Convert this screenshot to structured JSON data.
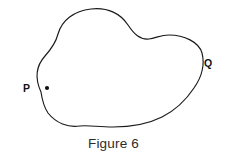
{
  "figure": {
    "caption": "Figure 6",
    "background_color": "#ffffff",
    "stroke_color": "#1a1a1a",
    "label_color": "#111111",
    "shape": {
      "name": "closed-freeform-blob",
      "description": "Irregular closed freeform curve (blob) drawn by hand, wider than tall, with a rounded peak at upper left, a wavy indentation along the upper right, a rounded right lobe, and a gentle bump along the bottom edge.",
      "outline_path": "M 41,92 C 35,79 36,66 45,56 C 53,47 56,42 58,34 C 62,20 74,11 91,9 C 108,7 121,14 128,25 C 134,34 140,40 149,39 C 156,38 161,35 169,35 C 184,35 199,42 202,53 C 205,65 201,78 194,88 C 186,100 176,110 162,117 C 148,124 131,127 113,127 C 98,127 88,125 80,126 C 68,128 56,123 48,113 C 44,107 42,99 41,92 Z"
    },
    "points": [
      {
        "id": "P",
        "label": "P",
        "x": 47,
        "y": 88,
        "label_x": 30,
        "label_y": 88,
        "marker": "dot"
      },
      {
        "id": "Q",
        "label": "Q",
        "x": 201,
        "y": 62,
        "label_x": 204,
        "label_y": 64,
        "marker": "none"
      }
    ]
  }
}
